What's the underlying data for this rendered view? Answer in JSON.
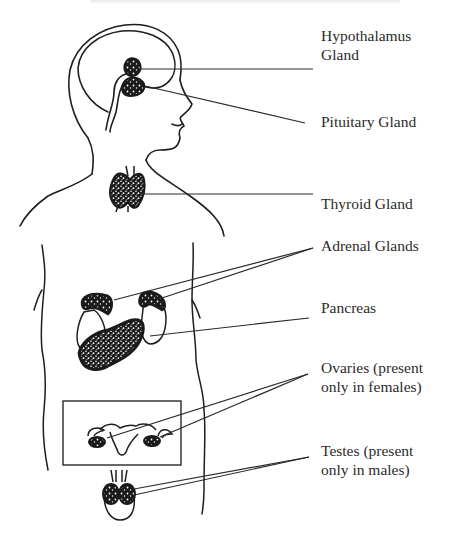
{
  "diagram": {
    "colors": {
      "outline": "#1e1e1e",
      "gland_fill": "#1a1a1a",
      "gland_speckle": "#ffffff",
      "leader_line": "#2a2a2a",
      "label_text": "#2b2b2b",
      "background": "#ffffff"
    },
    "labels": [
      {
        "id": "hypothalamus",
        "text": "Hypothalamus\nGland",
        "x": 321,
        "y": 35
      },
      {
        "id": "pituitary",
        "text": "Pituitary Gland",
        "x": 321,
        "y": 110
      },
      {
        "id": "thyroid",
        "text": "Thyroid Gland",
        "x": 321,
        "y": 194
      },
      {
        "id": "adrenal",
        "text": "Adrenal Glands",
        "x": 321,
        "y": 234
      },
      {
        "id": "pancreas",
        "text": "Pancreas",
        "x": 321,
        "y": 296
      },
      {
        "id": "ovaries",
        "text": "Ovaries (present\nonly in females)",
        "x": 321,
        "y": 357
      },
      {
        "id": "testes",
        "text": "Testes (present\nonly in males)",
        "x": 321,
        "y": 441
      }
    ],
    "leader_lines": [
      {
        "to": "hypothalamus",
        "from": [
          137,
          69
        ],
        "end": [
          313,
          69
        ]
      },
      {
        "to": "pituitary",
        "from": [
          145,
          86
        ],
        "end": [
          305,
          123
        ]
      },
      {
        "to": "thyroid",
        "from": [
          140,
          194
        ],
        "end": [
          313,
          194
        ]
      },
      {
        "to": "adrenal",
        "from": [
          114,
          300
        ],
        "end": [
          313,
          248
        ]
      },
      {
        "to": "adrenal",
        "from": [
          162,
          298
        ],
        "end": [
          313,
          248
        ]
      },
      {
        "to": "pancreas",
        "from": [
          150,
          336
        ],
        "end": [
          309,
          318
        ]
      },
      {
        "to": "ovaries",
        "from": [
          107,
          438
        ],
        "end": [
          308,
          374
        ]
      },
      {
        "to": "ovaries",
        "from": [
          160,
          437
        ],
        "end": [
          308,
          374
        ]
      },
      {
        "to": "testes",
        "from": [
          134,
          489
        ],
        "end": [
          309,
          457
        ]
      },
      {
        "to": "testes",
        "from": [
          134,
          495
        ],
        "end": [
          309,
          457
        ]
      }
    ],
    "female_box": {
      "x": 63,
      "y": 401,
      "width": 118,
      "height": 64
    }
  }
}
